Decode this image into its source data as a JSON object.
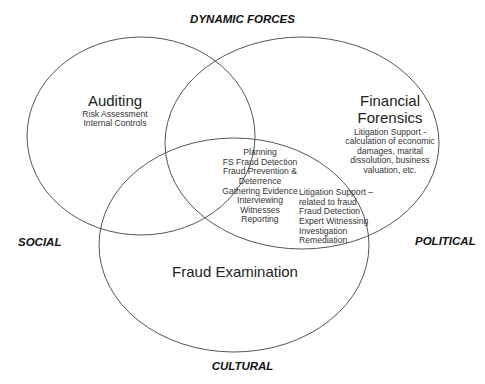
{
  "forces": {
    "top": "DYNAMIC FORCES",
    "left": "SOCIAL",
    "right": "POLITICAL",
    "bottom": "CULTURAL"
  },
  "circles": {
    "auditing": {
      "title": "Auditing",
      "items": [
        "Risk Assessment",
        "Internal Controls"
      ]
    },
    "financial_forensics": {
      "title_line1": "Financial",
      "title_line2": "Forensics",
      "items": [
        "Litigation Support -",
        "calculation of economic",
        "damages, marital",
        "dissolution, business",
        "valuation, etc."
      ]
    },
    "fraud_examination": {
      "title": "Fraud Examination"
    }
  },
  "overlaps": {
    "center": {
      "items": [
        "Planning",
        "FS Fraud Detection",
        "Fraud Prevention &",
        "Deterrence",
        "Gathering Evidence",
        "Interviewing",
        "Witnesses",
        "Reporting"
      ]
    },
    "forensics_fraud": {
      "items": [
        "Litigation Support –",
        "related to fraud",
        "Fraud Detection",
        "Expert Witnessing",
        "Investigation",
        "Remediation"
      ]
    }
  },
  "style": {
    "stroke": "#555555",
    "background": "#ffffff"
  }
}
